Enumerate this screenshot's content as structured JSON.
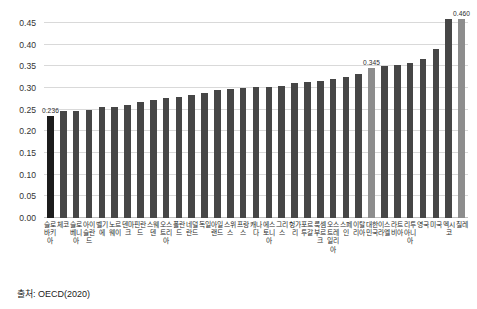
{
  "chart_data": {
    "type": "bar",
    "title": "",
    "xlabel": "",
    "ylabel": "",
    "ylim": [
      0.0,
      0.475
    ],
    "yticks": [
      "0.00",
      "0.05",
      "0.10",
      "0.15",
      "0.20",
      "0.25",
      "0.30",
      "0.35",
      "0.40",
      "0.45"
    ],
    "ytick_values": [
      0.0,
      0.05,
      0.1,
      0.15,
      0.2,
      0.25,
      0.3,
      0.35,
      0.4,
      0.45
    ],
    "grid": true,
    "legend": "none",
    "categories": [
      "슬로바키아",
      "체코",
      "슬로베니아",
      "아이슬란드",
      "벨기에",
      "노르웨이",
      "덴마크",
      "핀란드",
      "스웨덴",
      "오스트리아",
      "폴란드",
      "네덜란드",
      "독일",
      "아일랜드",
      "스위스",
      "프랑스",
      "캐나다",
      "에스토니아",
      "그리스",
      "헝가리",
      "포르투갈",
      "룩셈부르크",
      "오스트레일리아",
      "스페인",
      "이탈리아",
      "대한민국",
      "이스라엘",
      "라트비아",
      "리투아니아",
      "영국",
      "미국",
      "멕시코",
      "칠레"
    ],
    "values": [
      0.236,
      0.247,
      0.247,
      0.248,
      0.256,
      0.257,
      0.261,
      0.268,
      0.273,
      0.277,
      0.279,
      0.284,
      0.288,
      0.295,
      0.298,
      0.3,
      0.301,
      0.302,
      0.305,
      0.311,
      0.314,
      0.315,
      0.32,
      0.325,
      0.331,
      0.345,
      0.351,
      0.352,
      0.357,
      0.366,
      0.39,
      0.458,
      0.46
    ],
    "bar_colors": [
      "black",
      "normal",
      "normal",
      "normal",
      "normal",
      "normal",
      "normal",
      "normal",
      "normal",
      "normal",
      "normal",
      "normal",
      "normal",
      "normal",
      "normal",
      "normal",
      "normal",
      "normal",
      "normal",
      "normal",
      "normal",
      "normal",
      "normal",
      "normal",
      "normal",
      "highlight",
      "normal",
      "normal",
      "normal",
      "normal",
      "normal",
      "normal",
      "highlight"
    ],
    "data_labels": [
      {
        "index": 0,
        "text": "0.236"
      },
      {
        "index": 25,
        "text": "0.345"
      },
      {
        "index": 32,
        "text": "0.460"
      }
    ],
    "colors": {
      "bar_default": "#464646",
      "bar_black": "#1c1c1c",
      "bar_highlight": "#8d8d8d",
      "gridline": "#d9d9d9",
      "axis": "#bfbfbf",
      "text": "#2b2b2b",
      "background": "#ffffff"
    }
  },
  "footer": {
    "source_text": "출처: OECD(2020)"
  }
}
